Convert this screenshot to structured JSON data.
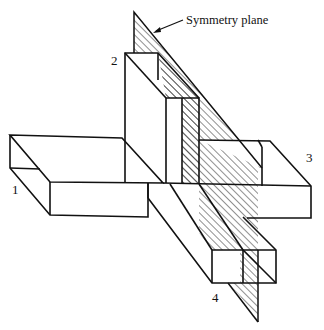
{
  "diagram": {
    "callout": {
      "text": "Symmetry plane"
    },
    "ports": [
      {
        "id": "port-1",
        "label": "1"
      },
      {
        "id": "port-2",
        "label": "2"
      },
      {
        "id": "port-3",
        "label": "3"
      },
      {
        "id": "port-4",
        "label": "4"
      }
    ],
    "colors": {
      "line": "#111111",
      "hatch": "#222222",
      "background": "#ffffff"
    }
  }
}
